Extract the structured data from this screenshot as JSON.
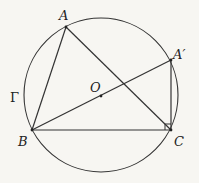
{
  "diagram": {
    "title": "",
    "circle": {
      "name": "Γ",
      "center_label": "O"
    },
    "points": {
      "A": "A",
      "A_prime": "A′",
      "B": "B",
      "C": "C",
      "O": "O"
    },
    "segments": [
      "AB",
      "AC",
      "BC",
      "BA′",
      "A′C"
    ],
    "right_angle_at": "C",
    "colors": {
      "stroke": "#333333",
      "background": "#f7f6f2"
    }
  }
}
